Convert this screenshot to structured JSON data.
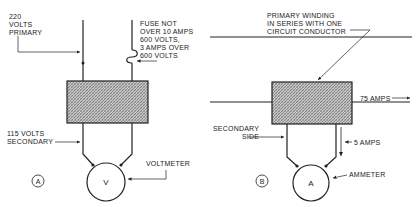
{
  "diagram_a": {
    "badge": "A",
    "primary_label": "220\nVOLTS\nPRIMARY",
    "fuse_label": "FUSE NOT\nOVER 10 AMPS\n600 VOLTS,\n3 AMPS OVER\n600 VOLTS",
    "secondary_label": "115 VOLTS\nSECONDARY",
    "meter_symbol": "V",
    "meter_label": "VOLTMETER"
  },
  "diagram_b": {
    "badge": "B",
    "primary_label": "PRIMARY WINDING\nIN SERIES WITH ONE\nCIRCUIT CONDUCTOR",
    "line_current_label": "75 AMPS",
    "secondary_label": "SECONDARY\nSIDE",
    "secondary_current_label": "5 AMPS",
    "meter_symbol": "A",
    "meter_label": "AMMETER"
  },
  "colors": {
    "ink": "#222222",
    "hatch": "#9a9a9a"
  }
}
